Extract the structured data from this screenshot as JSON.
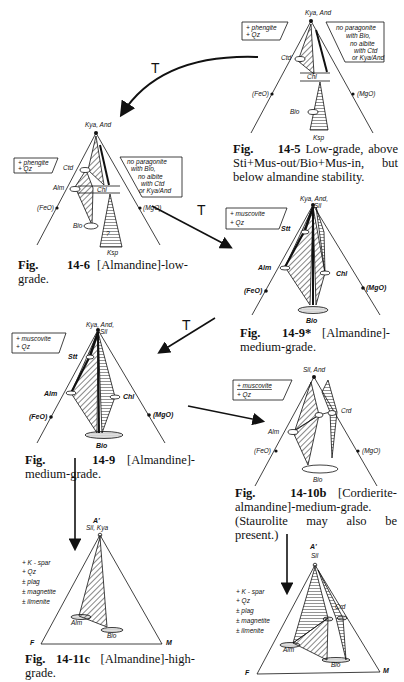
{
  "figures": [
    {
      "id": "14-5",
      "caption_fig": "Fig.",
      "caption_num": "14-5",
      "caption_text": "Low-grade, above Sti+Mus-out/Bio+Mus-in, but below almandine stability.",
      "apex_label": "Kya, And",
      "left_label": "(FeO)",
      "right_label": "(MgO)",
      "phase_labels": [
        "Ctd",
        "Chl",
        "Bio",
        "Ksp"
      ],
      "left_box": [
        "+ phengite",
        "+ Qz"
      ],
      "right_box": [
        "no paragonite",
        "with Bio,",
        "no albite",
        "with Ctd",
        "or Kya/And"
      ]
    },
    {
      "id": "14-6",
      "caption_fig": "Fig.",
      "caption_num": "14-6",
      "caption_text": "[Almandine]-low-grade.",
      "apex_label": "Kya, And",
      "left_label": "(FeO)",
      "right_label": "(MgO)",
      "phase_labels": [
        "Ctd",
        "Alm",
        "Chl",
        "Bio",
        "Ksp",
        "?"
      ],
      "left_box": [
        "+ phengite",
        "+ Qz"
      ],
      "right_box": [
        "no paragonite",
        "with Bio,",
        "no albite",
        "with Ctd",
        "or Kya/And"
      ]
    },
    {
      "id": "14-9*",
      "caption_fig": "Fig.",
      "caption_num": "14-9*",
      "caption_text": "[Almandine]-medium-grade.",
      "apex_label": "Kya, And, Sil",
      "left_label": "(FeO)",
      "right_label": "(MgO)",
      "phase_labels": [
        "Stt",
        "Alm",
        "Chl",
        "Bio"
      ],
      "left_box": [
        "+ muscovite",
        "+ Qz"
      ]
    },
    {
      "id": "14-9",
      "caption_fig": "Fig.",
      "caption_num": "14-9",
      "caption_text": "[Almandine]-medium-grade.",
      "apex_label": "Kya, And, Sil",
      "left_label": "(FeO)",
      "right_label": "(MgO)",
      "phase_labels": [
        "Stt",
        "Alm",
        "Chl",
        "Bio"
      ],
      "left_box": [
        "+ muscovite",
        "+ Qz"
      ]
    },
    {
      "id": "14-10b",
      "caption_fig": "Fig.",
      "caption_num": "14-10b",
      "caption_text": "[Cordierite-almandine]-medium-grade. (Staurolite may also be present.)",
      "apex_label": "Sil, And",
      "left_label": "(FeO)",
      "right_label": "(MgO)",
      "phase_labels": [
        "Alm",
        "Crd",
        "Bio"
      ],
      "left_box": [
        "+ muscovite",
        "+ Qz"
      ]
    },
    {
      "id": "14-11c-left",
      "caption_fig": "Fig.",
      "caption_num": "14-11c",
      "caption_text": "[Almandine]-high-grade.",
      "apex_top": "A'",
      "apex_label": "Sil, Kya",
      "left_label": "F",
      "right_label": "M",
      "phase_labels": [
        "Alm",
        "Bio"
      ],
      "assemblage": [
        "+ K-spar",
        "+ Qz",
        "± plag",
        "± magnetite",
        "± ilmenite"
      ]
    },
    {
      "id": "14-11c-right",
      "apex_top": "A'",
      "apex_label": "Sil",
      "left_label": "F",
      "right_label": "M",
      "phase_labels": [
        "Alm",
        "Crd",
        "Bio"
      ],
      "assemblage": [
        "+ K-spar",
        "+ Qz",
        "± plag",
        "± magnetite",
        "± ilmenite"
      ]
    }
  ],
  "arrows": {
    "label": "T"
  }
}
